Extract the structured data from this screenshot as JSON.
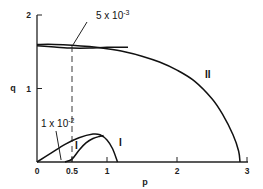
{
  "chart_data": {
    "type": "line",
    "title": "",
    "xlabel": "p",
    "ylabel": "q",
    "xlim": [
      0,
      3
    ],
    "ylim": [
      0,
      2
    ],
    "xticks": [
      0,
      0.5,
      1,
      2,
      3
    ],
    "xtick_labels": [
      "0",
      "0.5",
      "1",
      "2",
      "3"
    ],
    "yticks": [
      0,
      1,
      2
    ],
    "ytick_labels": [
      "0",
      "1",
      "2"
    ],
    "grid": false,
    "series": [
      {
        "name": "II",
        "label": "II",
        "branch": "outer",
        "x": [
          0,
          0.25,
          0.5,
          0.75,
          1.0,
          1.25,
          1.5,
          1.75,
          2.0,
          2.25,
          2.5,
          2.65,
          2.8,
          2.88,
          2.9
        ],
        "y": [
          1.6,
          1.6,
          1.59,
          1.57,
          1.54,
          1.5,
          1.44,
          1.36,
          1.25,
          1.1,
          0.86,
          0.65,
          0.37,
          0.15,
          0
        ]
      },
      {
        "name": "II-inner",
        "label": "",
        "branch": "inner",
        "x": [
          0,
          0.25,
          0.5,
          0.75,
          1.0,
          1.3
        ],
        "y": [
          1.58,
          1.565,
          1.55,
          1.55,
          1.56,
          1.56
        ]
      },
      {
        "name": "I",
        "label": "I",
        "branch": "outer",
        "x": [
          0,
          0.2,
          0.4,
          0.6,
          0.8,
          0.9,
          1.0,
          1.08,
          1.15
        ],
        "y": [
          0,
          0.12,
          0.24,
          0.33,
          0.38,
          0.37,
          0.3,
          0.18,
          0
        ]
      },
      {
        "name": "I-inner",
        "label": "",
        "branch": "inner",
        "x": [
          0.4,
          0.5,
          0.6,
          0.7,
          0.8,
          0.9,
          0.95
        ],
        "y": [
          0,
          0.04,
          0.16,
          0.26,
          0.32,
          0.35,
          0.36
        ]
      }
    ],
    "reference_line": {
      "type": "vertical",
      "x": 0.5,
      "style": "dashed",
      "y_from": 0,
      "y_to": 1.6
    },
    "annotations": [
      {
        "text": "5 x 10",
        "exponent": "-3",
        "points_to": {
          "x": 0.5,
          "y": 1.58
        }
      },
      {
        "text": "1 x 10",
        "exponent": "-2",
        "points_to": {
          "x": 0.33,
          "y": 0
        }
      },
      {
        "text": "I",
        "near_series": "I"
      },
      {
        "text": "II",
        "near_series": "II"
      }
    ]
  }
}
